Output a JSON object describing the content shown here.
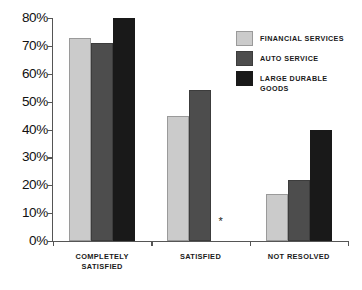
{
  "chart_data": {
    "type": "bar",
    "title": "",
    "xlabel": "",
    "ylabel": "",
    "ylim": [
      0,
      80
    ],
    "ytick_labels": [
      "80%",
      "70%",
      "60%",
      "50%",
      "40%",
      "30%",
      "20%",
      "10%",
      "0%"
    ],
    "ytick_values": [
      80,
      70,
      60,
      50,
      40,
      30,
      20,
      10,
      0
    ],
    "grid": false,
    "legend_position": "top-right",
    "categories": [
      "COMPLETELY\nSATISFIED",
      "SATISFIED",
      "NOT RESOLVED"
    ],
    "series": [
      {
        "name": "FINANCIAL SERVICES",
        "color": "#cbcbcb",
        "values": [
          73,
          45,
          17
        ]
      },
      {
        "name": "AUTO SERVICE",
        "color": "#4d4d4d",
        "values": [
          71,
          54,
          22
        ]
      },
      {
        "name": "LARGE DURABLE\nGOODS",
        "color": "#191919",
        "values": [
          80,
          null,
          40
        ]
      }
    ],
    "annotations": [
      {
        "name": "missing-data-asterisk",
        "text": "*",
        "category": "SATISFIED",
        "series": "LARGE DURABLE GOODS"
      }
    ]
  }
}
